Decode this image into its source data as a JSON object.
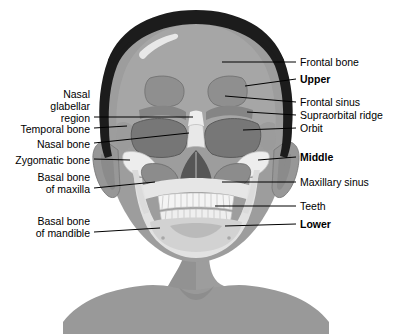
{
  "figure": {
    "colors": {
      "background": "#ffffff",
      "hair": "#1c1c1c",
      "skin": "#9d9d9d",
      "skin_shadow": "#8e8e8e",
      "skin_highlight": "#b4b4b4",
      "bone_light": "#e4e4e4",
      "bone_mid": "#c9c9c9",
      "bone_dark": "#8a8a8a",
      "sinus": "#9a9a9a",
      "orbit_dark": "#6f6f6f",
      "nasal_cavity": "#5a5a5a",
      "leader_line": "#000000",
      "text": "#000000"
    }
  },
  "labels": {
    "left": [
      {
        "id": "nasal-glabellar-region",
        "lines": [
          "Nasal",
          "glabellar",
          "region"
        ],
        "bold": false
      },
      {
        "id": "temporal-bone",
        "lines": [
          "Temporal bone"
        ],
        "bold": false
      },
      {
        "id": "nasal-bone",
        "lines": [
          "Nasal bone"
        ],
        "bold": false
      },
      {
        "id": "zygomatic-bone",
        "lines": [
          "Zygomatic bone"
        ],
        "bold": false
      },
      {
        "id": "basal-bone-of-maxilla",
        "lines": [
          "Basal bone",
          "of maxilla"
        ],
        "bold": false
      },
      {
        "id": "basal-bone-of-mandible",
        "lines": [
          "Basal bone",
          "of mandible"
        ],
        "bold": false
      }
    ],
    "right": [
      {
        "id": "frontal-bone",
        "lines": [
          "Frontal bone"
        ],
        "bold": false
      },
      {
        "id": "upper",
        "lines": [
          "Upper"
        ],
        "bold": true
      },
      {
        "id": "frontal-sinus",
        "lines": [
          "Frontal sinus"
        ],
        "bold": false
      },
      {
        "id": "supraorbital-ridge",
        "lines": [
          "Supraorbital ridge"
        ],
        "bold": false
      },
      {
        "id": "orbit",
        "lines": [
          "Orbit"
        ],
        "bold": false
      },
      {
        "id": "middle",
        "lines": [
          "Middle"
        ],
        "bold": true
      },
      {
        "id": "maxillary-sinus",
        "lines": [
          "Maxillary sinus"
        ],
        "bold": false
      },
      {
        "id": "teeth",
        "lines": [
          "Teeth"
        ],
        "bold": false
      },
      {
        "id": "lower",
        "lines": [
          "Lower"
        ],
        "bold": true
      }
    ]
  },
  "label_text": {
    "nasal_1": "Nasal",
    "nasal_2": "glabellar",
    "nasal_3": "region",
    "temporal_bone": "Temporal bone",
    "nasal_bone": "Nasal bone",
    "zygomatic_bone": "Zygomatic bone",
    "maxilla_1": "Basal bone",
    "maxilla_2": "of maxilla",
    "mandible_1": "Basal bone",
    "mandible_2": "of mandible",
    "frontal_bone": "Frontal bone",
    "upper": "Upper",
    "frontal_sinus": "Frontal sinus",
    "supraorbital_ridge": "Supraorbital ridge",
    "orbit": "Orbit",
    "middle": "Middle",
    "maxillary_sinus": "Maxillary sinus",
    "teeth": "Teeth",
    "lower": "Lower"
  }
}
